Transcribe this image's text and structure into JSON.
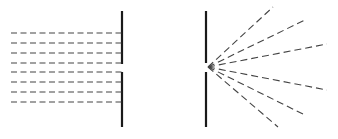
{
  "diagram": {
    "type": "single-slit-diffraction-comparison",
    "colors": {
      "line": "#1a1a1a",
      "dash": "#444444",
      "background": "#ffffff"
    },
    "left_panel": {
      "description": "plane wave passing through a wide opening",
      "barrier": {
        "x": 122,
        "top_segment": [
          11,
          64
        ],
        "bottom_segment": [
          72,
          127
        ]
      },
      "wavefronts_y": [
        33,
        43,
        53,
        63,
        72,
        82,
        92,
        102
      ],
      "wavefront_x_start": 11,
      "wavefront_x_end": 122
    },
    "right_panel": {
      "description": "waves spreading from a narrow slit",
      "barrier": {
        "x": 206,
        "top_segment": [
          11,
          63
        ],
        "bottom_segment": [
          72,
          127
        ]
      },
      "source": {
        "x": 208,
        "y": 67
      },
      "rays_end": [
        {
          "x": 273,
          "y": 7
        },
        {
          "x": 305,
          "y": 20
        },
        {
          "x": 327,
          "y": 44
        },
        {
          "x": 327,
          "y": 90
        },
        {
          "x": 305,
          "y": 115
        },
        {
          "x": 278,
          "y": 127
        }
      ]
    }
  }
}
